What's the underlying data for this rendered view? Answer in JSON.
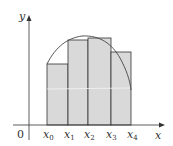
{
  "diagram": {
    "type": "riemann-sum",
    "axes": {
      "x_label": "x",
      "y_label": "y",
      "origin_label": "0"
    },
    "ticks": [
      {
        "base": "x",
        "sub": "0"
      },
      {
        "base": "x",
        "sub": "1"
      },
      {
        "base": "x",
        "sub": "2"
      },
      {
        "base": "x",
        "sub": "3"
      },
      {
        "base": "x",
        "sub": "4"
      }
    ],
    "colors": {
      "bar_fill": "#d9d9d9",
      "bar_stroke": "#333333",
      "curve": "#444444",
      "axis": "#333333"
    }
  }
}
